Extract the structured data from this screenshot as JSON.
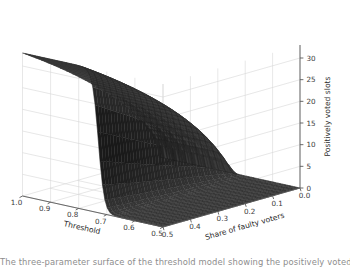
{
  "figure": {
    "background": "#ffffff",
    "surface_color": "#3b3b3b",
    "surface_edge_color": "#1a1a1a",
    "pane_color": "#ffffff",
    "grid_color": "#d7d7d7",
    "axis_line_color": "#5a5a5a",
    "tick_text_color": "#3a3a3a"
  },
  "caption_fragment": "The three-parameter surface of the threshold model showing the positively voted slots",
  "chart_data": {
    "type": "surface",
    "title": "",
    "xlabel": "Threshold",
    "ylabel": "Share of faulty voters",
    "zlabel": "Positively voted slots",
    "xticks": [
      "1.0",
      "0.9",
      "0.8",
      "0.7",
      "0.6",
      "0.5"
    ],
    "xtick_values": [
      1.0,
      0.9,
      0.8,
      0.7,
      0.6,
      0.5
    ],
    "yticks": [
      "0.5",
      "0.4",
      "0.3",
      "0.2",
      "0.1",
      "0.0"
    ],
    "ytick_values": [
      0.5,
      0.4,
      0.3,
      0.2,
      0.1,
      0.0
    ],
    "zticks": [
      "0",
      "5",
      "10",
      "15",
      "20",
      "25",
      "30"
    ],
    "ztick_values": [
      0,
      5,
      10,
      15,
      20,
      25,
      30
    ],
    "xlim": [
      0.5,
      1.0
    ],
    "ylim": [
      0.0,
      0.5
    ],
    "zlim": [
      0,
      33
    ],
    "grid": true,
    "legend": null,
    "colormap": "dark-gray-solid",
    "plateau_high": 33,
    "plateau_low": 0,
    "transition_threshold": 0.73,
    "series": [
      {
        "name": "share=0.50",
        "x": [
          0.5,
          0.55,
          0.6,
          0.65,
          0.7,
          0.72,
          0.74,
          0.76,
          0.78,
          0.8,
          0.85,
          0.9,
          0.95,
          1.0
        ],
        "z": [
          0,
          0,
          0,
          0,
          0.3,
          2,
          12,
          27,
          32,
          33,
          33,
          33,
          33,
          33
        ]
      },
      {
        "name": "share=0.40",
        "x": [
          0.5,
          0.55,
          0.6,
          0.65,
          0.7,
          0.72,
          0.74,
          0.76,
          0.78,
          0.8,
          0.85,
          0.9,
          0.95,
          1.0
        ],
        "z": [
          0,
          0,
          0,
          0,
          0.3,
          2,
          11,
          26,
          31,
          32,
          32,
          32,
          32,
          32
        ]
      },
      {
        "name": "share=0.30",
        "x": [
          0.5,
          0.55,
          0.6,
          0.65,
          0.7,
          0.72,
          0.74,
          0.76,
          0.78,
          0.8,
          0.85,
          0.9,
          0.95,
          1.0
        ],
        "z": [
          0,
          0,
          0,
          0,
          0.2,
          1.6,
          9,
          24,
          29,
          30,
          30,
          30,
          30,
          30
        ]
      },
      {
        "name": "share=0.20",
        "x": [
          0.5,
          0.55,
          0.6,
          0.65,
          0.7,
          0.72,
          0.74,
          0.76,
          0.78,
          0.8,
          0.85,
          0.9,
          0.95,
          1.0
        ],
        "z": [
          0,
          0,
          0,
          0,
          0.2,
          1.2,
          7,
          20,
          25,
          26,
          26,
          26,
          26,
          26
        ]
      },
      {
        "name": "share=0.10",
        "x": [
          0.5,
          0.55,
          0.6,
          0.65,
          0.7,
          0.72,
          0.74,
          0.76,
          0.78,
          0.8,
          0.85,
          0.9,
          0.95,
          1.0
        ],
        "z": [
          0,
          0,
          0,
          0,
          0.1,
          0.7,
          4,
          12,
          16,
          17,
          17,
          17,
          17,
          17
        ]
      },
      {
        "name": "share=0.00",
        "x": [
          0.5,
          0.55,
          0.6,
          0.65,
          0.7,
          0.72,
          0.74,
          0.76,
          0.78,
          0.8,
          0.85,
          0.9,
          0.95,
          1.0
        ],
        "z": [
          0,
          0,
          0,
          0,
          0,
          0,
          0,
          0,
          0,
          0,
          0,
          0,
          0,
          0
        ]
      }
    ]
  }
}
